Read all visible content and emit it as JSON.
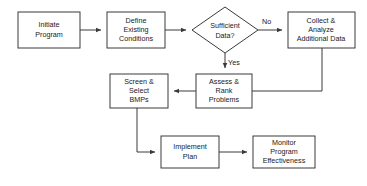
{
  "diagram": {
    "type": "flowchart",
    "background_color": "#ffffff",
    "line_color": "#3a3a3a",
    "text_color": "#1a1a1a",
    "nodes": [
      {
        "id": "initiate-program",
        "shape": "rectangle",
        "lines": [
          "Initiate",
          "Program"
        ],
        "x": 18,
        "y": 12,
        "w": 62,
        "h": 36
      },
      {
        "id": "define-existing-conditions",
        "shape": "rectangle",
        "lines": [
          "Define",
          "Existing",
          "Conditions"
        ],
        "x": 107,
        "y": 12,
        "w": 58,
        "h": 36
      },
      {
        "id": "sufficient-data",
        "shape": "diamond",
        "lines": [
          "Sufficient",
          "Data?"
        ],
        "x": 192,
        "y": 7,
        "w": 66,
        "h": 46
      },
      {
        "id": "collect-analyze-additional-data",
        "shape": "rectangle",
        "lines": [
          "Collect &",
          "Analyze",
          "Additional Data"
        ],
        "x": 288,
        "y": 12,
        "w": 67,
        "h": 36
      },
      {
        "id": "screen-select-bmps",
        "shape": "rectangle",
        "lines": [
          "Screen &",
          "Select",
          "BMPs"
        ],
        "x": 110,
        "y": 74,
        "w": 58,
        "h": 34
      },
      {
        "id": "assess-rank-problems",
        "shape": "rectangle",
        "lines": [
          "Assess &",
          "Rank",
          "Problems"
        ],
        "x": 196,
        "y": 74,
        "w": 56,
        "h": 34
      },
      {
        "id": "implement-plan",
        "shape": "rectangle",
        "lines": [
          "Implement",
          "Plan"
        ],
        "x": 161,
        "y": 136,
        "w": 58,
        "h": 32
      },
      {
        "id": "monitor-program-effectiveness",
        "shape": "rectangle",
        "lines": [
          "Monitor",
          "Program",
          "Effectiveness"
        ],
        "x": 253,
        "y": 136,
        "w": 62,
        "h": 32
      }
    ],
    "edge_labels": [
      {
        "id": "no-label",
        "text": "No",
        "x": 262,
        "y": 22
      },
      {
        "id": "yes-label",
        "text": "Yes",
        "x": 228,
        "y": 63
      }
    ],
    "node_text": {
      "initiate_program": "Initiate Program",
      "define_existing_conditions": "Define Existing Conditions",
      "sufficient_data": "Sufficient Data?",
      "collect_analyze": "Collect & Analyze Additional Data",
      "screen_select_bmps": "Screen & Select BMPs",
      "assess_rank_problems": "Assess & Rank Problems",
      "implement_plan": "Implement Plan",
      "monitor_program_effectiveness": "Monitor Program Effectiveness"
    }
  }
}
